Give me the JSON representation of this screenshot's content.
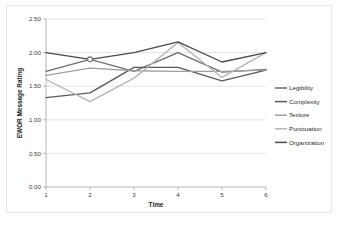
{
  "chart_data": {
    "type": "line",
    "title": "",
    "xlabel": "Time",
    "ylabel": "EWOR Message Rating",
    "x": [
      1,
      2,
      3,
      4,
      5,
      6
    ],
    "xtick_labels": [
      "1",
      "2",
      "3",
      "4",
      "5",
      "6"
    ],
    "ytick_labels": [
      "0.00",
      "0.50",
      "1.00",
      "1.50",
      "2.00",
      "2.50"
    ],
    "ytick_values": [
      0.0,
      0.5,
      1.0,
      1.5,
      2.0,
      2.5
    ],
    "ylim": [
      0.0,
      2.5
    ],
    "xlim": [
      1,
      6
    ],
    "grid": true,
    "legend_position": "right",
    "series": [
      {
        "name": "Legibility",
        "color": "#6f6f6f",
        "values": [
          1.72,
          1.9,
          1.72,
          2.0,
          1.71,
          1.75
        ]
      },
      {
        "name": "Complexity",
        "color": "#5a5a5a",
        "values": [
          1.33,
          1.4,
          1.78,
          1.78,
          1.58,
          1.74
        ]
      },
      {
        "name": "Texture",
        "color": "#a0a0a0",
        "values": [
          1.66,
          1.77,
          1.73,
          1.72,
          1.72,
          1.74
        ]
      },
      {
        "name": "Punctuation",
        "color": "#b5b5b5",
        "values": [
          1.6,
          1.27,
          1.62,
          2.15,
          1.63,
          2.0
        ]
      },
      {
        "name": "Organization",
        "color": "#4a4a4a",
        "values": [
          2.0,
          1.9,
          2.0,
          2.16,
          1.86,
          2.0
        ]
      }
    ],
    "markers": [
      {
        "series": "Legibility",
        "x": 2,
        "y": 1.9,
        "shape": "circle"
      }
    ]
  },
  "legend": {
    "items": [
      {
        "label": "Legibility"
      },
      {
        "label": "Complexity"
      },
      {
        "label": "Texture"
      },
      {
        "label": "Punctuation"
      },
      {
        "label": "Organization"
      }
    ]
  },
  "axes": {
    "y_title": "EWOR Message Rating",
    "x_title": "Time",
    "y_ticks": [
      "2.50",
      "2.00",
      "1.50",
      "1.00",
      "0.50",
      "0.00"
    ],
    "x_ticks": [
      "1",
      "2",
      "3",
      "4",
      "5",
      "6"
    ]
  }
}
